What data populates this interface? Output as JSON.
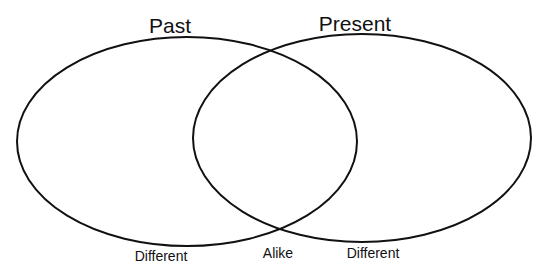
{
  "diagram": {
    "type": "venn",
    "stroke_color": "#111111",
    "background": "#ffffff",
    "sets": [
      {
        "title": "Past",
        "region_label": "Different"
      },
      {
        "title": "Present",
        "region_label": "Different"
      }
    ],
    "intersection_label": "Alike"
  }
}
